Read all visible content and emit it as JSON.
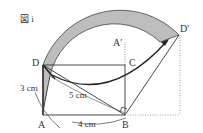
{
  "figure": {
    "title": "図 i",
    "points": {
      "A": "A",
      "B": "B",
      "C": "C",
      "D": "D",
      "A_prime": "A′",
      "D_prime": "D′"
    },
    "measurements": {
      "AD": "3 cm",
      "AB": "4 cm",
      "BD": "5 cm"
    },
    "colors": {
      "shaded_region": "#bdbdbd",
      "lines": "#333333"
    }
  }
}
